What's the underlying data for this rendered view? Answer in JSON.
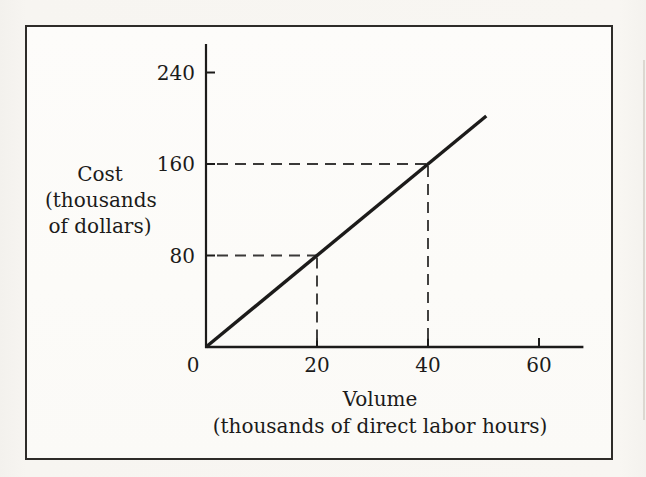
{
  "figure": {
    "kind": "scanned-textbook-figure",
    "paper_color": "#f7f5f1",
    "frame_fill": "#fcfbf8",
    "frame_border_color": "#2e2c29",
    "ink_color": "#1c1b1a",
    "dash_color": "#3a3938"
  },
  "chart_data": {
    "type": "line",
    "title": "",
    "xlabel": "Volume",
    "xlabel_sub": "(thousands of direct labor hours)",
    "ylabel_lines": [
      "Cost",
      "(thousands",
      "of dollars)"
    ],
    "x_ticks": [
      0,
      20,
      40,
      60
    ],
    "y_ticks": [
      80,
      160,
      240
    ],
    "xlim": [
      0,
      68
    ],
    "ylim": [
      0,
      265
    ],
    "grid": false,
    "legend": false,
    "series": [
      {
        "name": "total-cost-line",
        "style": "solid",
        "slope_cost_per_hour": 4,
        "points": [
          [
            0,
            0
          ],
          [
            50.5,
            202
          ]
        ]
      }
    ],
    "guides": [
      {
        "x": 20,
        "y": 80
      },
      {
        "x": 40,
        "y": 160
      }
    ]
  }
}
